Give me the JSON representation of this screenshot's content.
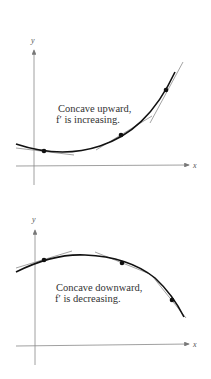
{
  "diagrams": [
    {
      "title": "concave-upward",
      "caption_line1": "Concave upward,",
      "caption_line2": "f′ is increasing.",
      "x_axis_label": "x",
      "y_axis_label": "y",
      "points": [
        [
          44,
          151
        ],
        [
          121,
          135
        ],
        [
          166,
          90
        ]
      ]
    },
    {
      "title": "concave-downward",
      "caption_line1": "Concave downward,",
      "caption_line2": "f′ is decreasing.",
      "x_axis_label": "x",
      "y_axis_label": "y",
      "points": [
        [
          44,
          260
        ],
        [
          122,
          263
        ],
        [
          172,
          300
        ]
      ]
    }
  ],
  "colors": {
    "curve": "#111111",
    "axis": "#777777",
    "tangent": "#999999"
  }
}
